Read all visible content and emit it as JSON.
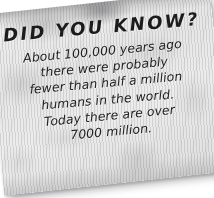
{
  "background_color": "#ffffff",
  "note": {
    "paper_color": "#e9e9e9",
    "text_color": "#1c1c1c",
    "rotation_degrees": -6,
    "headline": "DID YOU KNOW?",
    "body_lines": [
      "About 100,000 years ago",
      "there were probably",
      "fewer than half a million",
      "humans in the world.",
      "Today there are over",
      "7000 million."
    ]
  }
}
